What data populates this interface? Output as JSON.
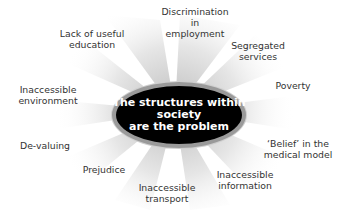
{
  "diagram": {
    "center": {
      "lines": [
        "The structures within",
        "society",
        "are the problem"
      ]
    },
    "spokes": [
      {
        "id": "discrimination",
        "lines": [
          "Discrimination",
          "in",
          "employment"
        ],
        "x": 195,
        "y": 6
      },
      {
        "id": "segregated",
        "lines": [
          "Segregated",
          "services"
        ],
        "x": 258,
        "y": 40
      },
      {
        "id": "poverty",
        "lines": [
          "Poverty"
        ],
        "x": 293,
        "y": 80
      },
      {
        "id": "belief",
        "lines": [
          "‘Belief’ in the",
          "medical model"
        ],
        "x": 298,
        "y": 138
      },
      {
        "id": "info",
        "lines": [
          "Inaccessible",
          "information"
        ],
        "x": 245,
        "y": 169
      },
      {
        "id": "transport",
        "lines": [
          "Inaccessible",
          "transport"
        ],
        "x": 167,
        "y": 182
      },
      {
        "id": "prejudice",
        "lines": [
          "Prejudice"
        ],
        "x": 104,
        "y": 164
      },
      {
        "id": "devaluing",
        "lines": [
          "De-valuing"
        ],
        "x": 45,
        "y": 140
      },
      {
        "id": "environment",
        "lines": [
          "Inaccessible",
          "environment"
        ],
        "x": 48,
        "y": 84
      },
      {
        "id": "education",
        "lines": [
          "Lack of useful",
          "education"
        ],
        "x": 92,
        "y": 28
      }
    ],
    "colors": {
      "hub_fill": "#000000",
      "hub_ring": "#9a9a9a",
      "text": "#333333",
      "ray": "#d9d9d9"
    }
  }
}
